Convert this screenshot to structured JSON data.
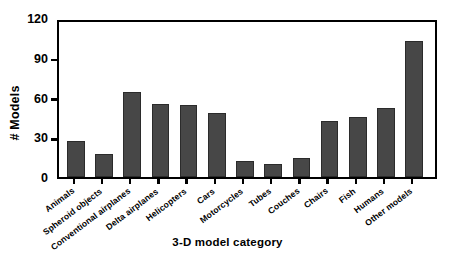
{
  "chart_data": {
    "type": "bar",
    "title": "",
    "xlabel": "3-D model category",
    "ylabel": "# Models",
    "categories": [
      "Animals",
      "Spheroid objects",
      "Conventional airplanes",
      "Delta airplanes",
      "Helicopters",
      "Cars",
      "Motorcycles",
      "Tubes",
      "Couches",
      "Chairs",
      "Fish",
      "Humans",
      "Other models"
    ],
    "values": [
      27,
      17,
      64,
      55,
      54,
      48,
      12,
      10,
      14,
      42,
      45,
      52,
      103
    ],
    "ylim": [
      0,
      120
    ],
    "yticks": [
      0,
      30,
      60,
      90,
      120
    ],
    "ytick_labels": [
      "0",
      "30",
      "60",
      "90",
      "120"
    ],
    "grid": false,
    "legend": null,
    "bar_color": "#474747",
    "axis_color": "#000000"
  }
}
